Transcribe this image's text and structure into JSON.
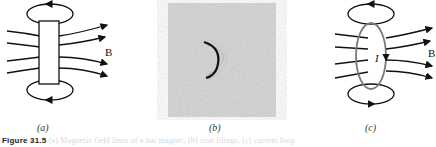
{
  "figure": {
    "panels": [
      {
        "id": "a",
        "label": "(a)",
        "description": "bar magnet with field lines B",
        "field_label": "B"
      },
      {
        "id": "b",
        "label": "(b)",
        "description": "photograph of iron filings around a semicircular current wire"
      },
      {
        "id": "c",
        "label": "(c)",
        "description": "current loop I with field lines B",
        "field_label": "B",
        "current_label": "I"
      }
    ],
    "caption": {
      "figure_number": "Figure 31.5",
      "text": "(a) Magnetic field lines of a bar magnet, (b) iron filings, (c) current loop"
    },
    "colors": {
      "line": "#111111",
      "loop": "#7a7a7a",
      "photo_bg": "#d4d4d4"
    }
  }
}
